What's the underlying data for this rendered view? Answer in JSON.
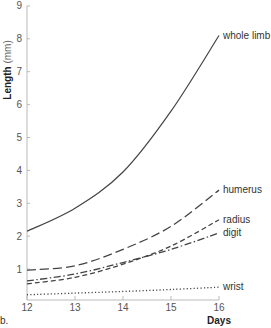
{
  "panel_label": "b.",
  "axes": {
    "ylabel": "Length",
    "yunit": "(mm)",
    "xlabel": "Days"
  },
  "colors": {
    "axis": "#bbbbbb",
    "line": "#444444",
    "text": "#555555"
  },
  "chart_data": {
    "type": "line",
    "title": "",
    "xlabel": "Days",
    "ylabel": "Length (mm)",
    "x": [
      12,
      13,
      14,
      15,
      16
    ],
    "xlim": [
      12,
      16
    ],
    "ylim": [
      0,
      9
    ],
    "xticks": [
      12,
      13,
      14,
      15,
      16
    ],
    "yticks": [
      1,
      2,
      3,
      4,
      5,
      6,
      7,
      8,
      9
    ],
    "grid": false,
    "legend_position": "inline labels at line ends",
    "series": [
      {
        "name": "whole limb",
        "style": "solid",
        "values": [
          2.15,
          2.85,
          3.95,
          5.8,
          8.1
        ]
      },
      {
        "name": "humerus",
        "style": "longdash",
        "values": [
          0.97,
          1.1,
          1.6,
          2.3,
          3.4
        ]
      },
      {
        "name": "radius",
        "style": "dash",
        "values": [
          0.55,
          0.75,
          1.15,
          1.7,
          2.5
        ]
      },
      {
        "name": "digit",
        "style": "dashdot",
        "values": [
          0.64,
          0.85,
          1.2,
          1.6,
          2.1
        ]
      },
      {
        "name": "wrist",
        "style": "dotted",
        "values": [
          0.22,
          0.27,
          0.32,
          0.38,
          0.45
        ]
      }
    ]
  }
}
